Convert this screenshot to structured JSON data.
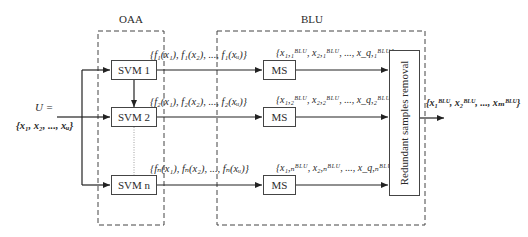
{
  "groups": {
    "oaa_label": "OAA",
    "blu_label": "BLU"
  },
  "input": {
    "label_line1": "U =",
    "label_line2": "{x₁, x₂, ..., xᵤ}"
  },
  "svms": [
    {
      "label": "SVM 1",
      "output_set": "{f₁(x₁), f₁(x₂), ..., f₁(xᵤ)}"
    },
    {
      "label": "SVM 2",
      "output_set": "{f₂(x₁), f₂(x₂), ..., f₂(xᵤ)}"
    },
    {
      "label": "SVM n",
      "output_set": "{fₙ(x₁), fₙ(x₂), ..., fₙ(xᵤ)}"
    }
  ],
  "ms_blocks": [
    {
      "label": "MS",
      "output_set": "{x₁,₁ᴮᴸᵁ, x₂,₁ᴮᴸᵁ, ..., x_q,₁ᴮᴸᵁ}"
    },
    {
      "label": "MS",
      "output_set": "{x₁,₂ᴮᴸᵁ, x₂,₂ᴮᴸᵁ, ..., x_q,₂ᴮᴸᵁ}"
    },
    {
      "label": "MS",
      "output_set": "{x₁,ₙᴮᴸᵁ, x₂,ₙᴮᴸᵁ, ..., x_q,ₙᴮᴸᵁ}"
    }
  ],
  "removal": {
    "label": "Redundant samples removal"
  },
  "output": {
    "label": "{x₁ᴮᴸᵁ, x₂ᴮᴸᵁ, ..., xₘᴮᴸᵁ}"
  }
}
